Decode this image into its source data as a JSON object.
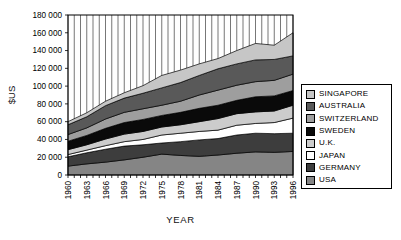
{
  "figure": {
    "background": "#ffffff",
    "plot_border_color": "#000000",
    "gridline_color": "#3c3c3c"
  },
  "y_axis": {
    "title": "$US",
    "tick_values": [
      0,
      20000,
      40000,
      60000,
      80000,
      100000,
      120000,
      140000,
      160000,
      180000
    ],
    "tick_labels": [
      "0",
      "20 000",
      "40 000",
      "60 000",
      "80 000",
      "100 000",
      "120 000",
      "140 000",
      "160 000",
      "180 000"
    ]
  },
  "x_axis": {
    "title": "YEAR",
    "tick_labels": [
      "1960",
      "1963",
      "1966",
      "1969",
      "1972",
      "1975",
      "1978",
      "1981",
      "1984",
      "1987",
      "1990",
      "1993",
      "1996"
    ]
  },
  "chart_data": {
    "type": "area",
    "stacked": true,
    "title": "",
    "xlabel": "YEAR",
    "ylabel": "$US",
    "ylim": [
      0,
      180000
    ],
    "x_range": [
      1960,
      1996
    ],
    "gridlines": "vertical-every-year",
    "legend_position": "right",
    "legend_order": "top-is-last-stacked-series",
    "x": [
      1960,
      1963,
      1966,
      1969,
      1972,
      1975,
      1978,
      1981,
      1984,
      1987,
      1990,
      1993,
      1996
    ],
    "series": [
      {
        "name": "USA",
        "color": "#858585",
        "values": [
          10000,
          12500,
          14500,
          17000,
          20000,
          23500,
          22000,
          21000,
          22500,
          24500,
          26000,
          25500,
          26500
        ]
      },
      {
        "name": "GERMANY",
        "color": "#3d3d3d",
        "values": [
          10500,
          12500,
          14500,
          15500,
          14000,
          12500,
          15500,
          18500,
          18500,
          20500,
          21000,
          21000,
          20500
        ]
      },
      {
        "name": "JAPAN",
        "color": "#ffffff",
        "values": [
          2500,
          3000,
          4000,
          5000,
          6000,
          9000,
          9500,
          9500,
          9500,
          11000,
          11000,
          12500,
          17000
        ]
      },
      {
        "name": "U.K.",
        "color": "#cccccc",
        "values": [
          5500,
          6000,
          7500,
          8500,
          9000,
          9000,
          9500,
          11000,
          13000,
          13000,
          13000,
          13000,
          14500
        ]
      },
      {
        "name": "SWEDEN",
        "color": "#0a0a0a",
        "values": [
          9500,
          10500,
          12000,
          13000,
          13500,
          13000,
          14000,
          15000,
          15000,
          15000,
          17000,
          17000,
          16500
        ]
      },
      {
        "name": "SWITZERLAND",
        "color": "#9e9e9e",
        "values": [
          7500,
          8500,
          10500,
          11500,
          12000,
          11500,
          12500,
          15000,
          17000,
          17000,
          17000,
          17500,
          18500
        ]
      },
      {
        "name": "AUSTRALIA",
        "color": "#595959",
        "values": [
          11000,
          12500,
          15000,
          16000,
          17500,
          19500,
          21000,
          22000,
          24000,
          24000,
          24500,
          23500,
          20500
        ]
      },
      {
        "name": "SINGAPORE",
        "color": "#c6c6c6",
        "values": [
          3500,
          4500,
          5000,
          6000,
          8500,
          14000,
          14000,
          13000,
          11500,
          15000,
          18500,
          16000,
          26000
        ]
      }
    ]
  }
}
